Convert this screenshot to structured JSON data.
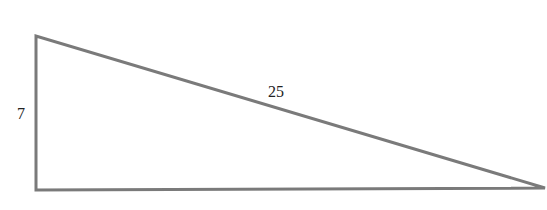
{
  "diagram": {
    "type": "right-triangle",
    "stroke_color": "#7a7a7a",
    "vertices": {
      "top_left": [
        36,
        36
      ],
      "bottom_left": [
        36,
        190
      ],
      "right": [
        545,
        188
      ]
    },
    "labels": {
      "vertical_side": "7",
      "hypotenuse": "25"
    }
  }
}
